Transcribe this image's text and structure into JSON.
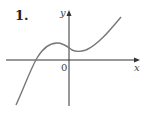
{
  "problem": {
    "number_label": "1."
  },
  "graph": {
    "x_label": "x",
    "y_label": "y",
    "origin_label": "0",
    "curve_color": "#777777",
    "axis_color": "#333333",
    "description": "Cubic-like curve: rises from lower left, crosses x-axis left of origin, local maximum left of y-axis, local minimum just right of y-axis above x-axis, then rises to upper right"
  }
}
